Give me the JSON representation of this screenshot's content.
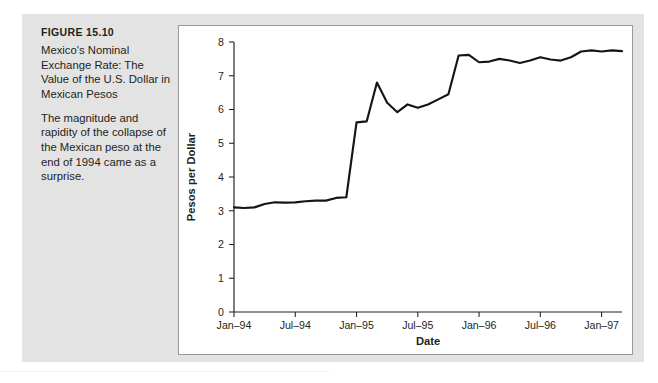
{
  "figure": {
    "label": "FIGURE 15.10",
    "title": "Mexico's Nominal Exchange Rate: The Value of the U.S. Dollar in Mexican Pesos",
    "description": "The magnitude and rapidity of the collapse of the Mexican peso at the end of 1994 came as a surprise."
  },
  "chart_data": {
    "type": "line",
    "title": "",
    "xlabel": "Date",
    "ylabel": "Pesos per Dollar",
    "ylim": [
      0,
      8
    ],
    "yticks": [
      0,
      1,
      2,
      3,
      4,
      5,
      6,
      7,
      8
    ],
    "ytick_labels": [
      "0",
      "1",
      "2",
      "3",
      "4",
      "5",
      "6",
      "7",
      "8"
    ],
    "xtick_labels": [
      "Jan–94",
      "Jul–94",
      "Jan–95",
      "Jul–95",
      "Jan–96",
      "Jul–96",
      "Jan–97"
    ],
    "xtick_x": [
      "1994-01",
      "1994-07",
      "1995-01",
      "1995-07",
      "1996-01",
      "1996-07",
      "1997-01"
    ],
    "grid": false,
    "legend": false,
    "line_color": "#151515",
    "x": [
      "1994-01",
      "1994-02",
      "1994-03",
      "1994-04",
      "1994-05",
      "1994-06",
      "1994-07",
      "1994-08",
      "1994-09",
      "1994-10",
      "1994-11",
      "1994-12",
      "1995-01",
      "1995-02",
      "1995-03",
      "1995-04",
      "1995-05",
      "1995-06",
      "1995-07",
      "1995-08",
      "1995-09",
      "1995-10",
      "1995-11",
      "1995-12",
      "1996-01",
      "1996-02",
      "1996-03",
      "1996-04",
      "1996-05",
      "1996-06",
      "1996-07",
      "1996-08",
      "1996-09",
      "1996-10",
      "1996-11",
      "1996-12",
      "1997-01",
      "1997-02",
      "1997-03"
    ],
    "values": [
      3.1,
      3.08,
      3.1,
      3.2,
      3.25,
      3.24,
      3.25,
      3.28,
      3.3,
      3.3,
      3.38,
      3.4,
      5.62,
      5.65,
      6.8,
      6.2,
      5.92,
      6.15,
      6.05,
      6.15,
      6.3,
      6.45,
      7.6,
      7.62,
      7.4,
      7.42,
      7.5,
      7.45,
      7.38,
      7.45,
      7.55,
      7.48,
      7.45,
      7.55,
      7.72,
      7.75,
      7.72,
      7.75,
      7.73
    ],
    "series_name": "Pesos per Dollar"
  },
  "footer": {
    "source_note": ""
  }
}
